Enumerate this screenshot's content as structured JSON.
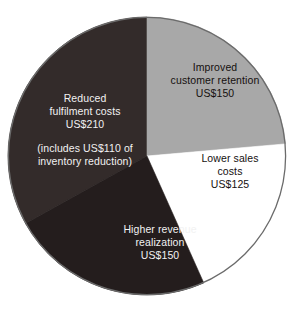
{
  "chart_data": {
    "type": "pie",
    "title": "",
    "subtitle": "",
    "xlabel": "",
    "ylabel": "",
    "legend_position": "none",
    "grid": false,
    "units": "US$",
    "total": 635,
    "center": {
      "x": 147,
      "y": 156
    },
    "radius": 139,
    "start_angle_deg": 0,
    "direction": "clockwise",
    "slices": [
      {
        "name": "improved-customer-retention",
        "label_lines": [
          "Improved",
          "customer retention",
          "US$150"
        ],
        "label_line1": "Improved",
        "label_line2": "customer retention",
        "label_line3": "US$150",
        "value": 150,
        "percent": 23.6,
        "angle_deg": 85.0,
        "start_deg": 0.0,
        "end_deg": 85.0,
        "color": "#a8a8a8",
        "text_color": "#15100f"
      },
      {
        "name": "lower-sales-costs",
        "label_lines": [
          "Lower sales",
          "costs",
          "US$125"
        ],
        "label_line1": "Lower sales",
        "label_line2": "costs",
        "label_line3": "US$125",
        "value": 125,
        "percent": 19.7,
        "angle_deg": 70.9,
        "start_deg": 85.0,
        "end_deg": 155.9,
        "color": "#ffffff",
        "text_color": "#15100f"
      },
      {
        "name": "higher-revenue-realization",
        "label_lines": [
          "Higher revenue",
          "realization",
          "US$150"
        ],
        "label_line1": "Higher revenue",
        "label_line2": "realization",
        "label_line3": "US$150",
        "value": 150,
        "percent": 23.6,
        "angle_deg": 85.0,
        "start_deg": 155.9,
        "end_deg": 240.9,
        "color": "#241d1d",
        "text_color": "#f2f2f2"
      },
      {
        "name": "reduced-fulfilment-costs",
        "label_lines": [
          "Reduced",
          "fulfilment costs",
          "US$210"
        ],
        "label_line1": "Reduced",
        "label_line2": "fulfilment costs",
        "label_line3": "US$210",
        "note_line1": "(includes US$110 of",
        "note_line2": "inventory reduction)",
        "value": 210,
        "percent": 33.1,
        "angle_deg": 119.1,
        "start_deg": 240.9,
        "end_deg": 360.0,
        "color": "#332b2a",
        "text_color": "#f2f2f2"
      }
    ],
    "categories": [
      "Improved customer retention",
      "Lower sales costs",
      "Higher revenue realization",
      "Reduced fulfilment costs"
    ],
    "values": [
      150,
      125,
      150,
      210
    ],
    "colors": [
      "#a8a8a8",
      "#ffffff",
      "#241d1d",
      "#332b2a"
    ],
    "outline_color": "#6b6b6b",
    "background": "#ffffff"
  }
}
